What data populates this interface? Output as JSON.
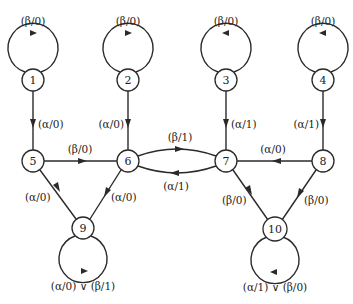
{
  "diagram": {
    "type": "state-transition-diagram",
    "nodes": [
      {
        "id": "1",
        "label": "1",
        "x": 33,
        "y": 80
      },
      {
        "id": "2",
        "label": "2",
        "x": 128,
        "y": 80
      },
      {
        "id": "3",
        "label": "3",
        "x": 226,
        "y": 80
      },
      {
        "id": "4",
        "label": "4",
        "x": 323,
        "y": 80
      },
      {
        "id": "5",
        "label": "5",
        "x": 33,
        "y": 161
      },
      {
        "id": "6",
        "label": "6",
        "x": 128,
        "y": 161
      },
      {
        "id": "7",
        "label": "7",
        "x": 226,
        "y": 161
      },
      {
        "id": "8",
        "label": "8",
        "x": 323,
        "y": 161
      },
      {
        "id": "9",
        "label": "9",
        "x": 83,
        "y": 228
      },
      {
        "id": "10",
        "label": "10",
        "x": 275,
        "y": 229
      }
    ],
    "edges": [
      {
        "from": "1",
        "to": "1",
        "label": "(β/0)"
      },
      {
        "from": "2",
        "to": "2",
        "label": "(β/0)"
      },
      {
        "from": "3",
        "to": "3",
        "label": "(β/0)"
      },
      {
        "from": "4",
        "to": "4",
        "label": "(β/0)"
      },
      {
        "from": "1",
        "to": "5",
        "label": "(α/0)"
      },
      {
        "from": "2",
        "to": "6",
        "label": "(α/0)"
      },
      {
        "from": "3",
        "to": "7",
        "label": "(α/1)"
      },
      {
        "from": "4",
        "to": "8",
        "label": "(α/1)"
      },
      {
        "from": "5",
        "to": "6",
        "label": "(β/0)"
      },
      {
        "from": "6",
        "to": "7",
        "label": "(β/1)"
      },
      {
        "from": "7",
        "to": "6",
        "label": "(α/1)"
      },
      {
        "from": "8",
        "to": "7",
        "label": "(α/0)"
      },
      {
        "from": "5",
        "to": "9",
        "label": "(α/0)"
      },
      {
        "from": "6",
        "to": "9",
        "label": "(α/0)"
      },
      {
        "from": "7",
        "to": "10",
        "label": "(β/0)"
      },
      {
        "from": "8",
        "to": "10",
        "label": "(β/0)"
      },
      {
        "from": "9",
        "to": "9",
        "label": "(α/0) ∨ (β/1)"
      },
      {
        "from": "10",
        "to": "10",
        "label": "(α/1) ∨ (β/0)"
      }
    ]
  }
}
